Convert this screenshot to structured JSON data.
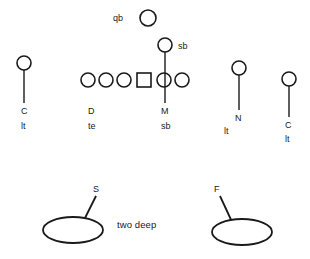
{
  "diagram": {
    "type": "football-defensive-formation",
    "caption": "two deep",
    "caption_pos": {
      "x": 117,
      "y": 220
    },
    "colors": {
      "stroke": "#1a1a1a",
      "fill": "#ffffff",
      "text": "#1a1a1a",
      "background": "#ffffff"
    },
    "canvas": {
      "width": 310,
      "height": 259
    },
    "line_of_scrimmage": {
      "note": "offensive line row of circles with center square",
      "y": 80
    },
    "offense": {
      "linemen": [
        {
          "name": "lineman-1",
          "shape": "circle",
          "cx": 88,
          "cy": 80,
          "r": 7
        },
        {
          "name": "lineman-2",
          "shape": "circle",
          "cx": 106,
          "cy": 80,
          "r": 7
        },
        {
          "name": "lineman-3",
          "shape": "circle",
          "cx": 124,
          "cy": 80,
          "r": 7
        },
        {
          "name": "center",
          "shape": "square",
          "cx": 144,
          "cy": 80,
          "size": 14
        },
        {
          "name": "lineman-4",
          "shape": "circle",
          "cx": 164,
          "cy": 80,
          "r": 7
        },
        {
          "name": "lineman-5",
          "shape": "circle",
          "cx": 182,
          "cy": 80,
          "r": 7
        }
      ],
      "backs": [
        {
          "name": "quarterback",
          "shape": "circle",
          "cx": 148,
          "cy": 18,
          "r": 8,
          "label": "qb",
          "label_pos": {
            "x": 113,
            "y": 14
          }
        },
        {
          "name": "slotback-top",
          "shape": "circle",
          "cx": 165,
          "cy": 45,
          "r": 7,
          "label": "sb",
          "label_pos": {
            "x": 178,
            "y": 42
          }
        }
      ]
    },
    "defenders": [
      {
        "name": "corner-left",
        "shape": "circle",
        "cx": 24,
        "cy": 63,
        "r": 7,
        "route": {
          "x1": 24,
          "y1": 63,
          "x2": 24,
          "y2": 103
        },
        "label_primary": "C",
        "label_secondary": "lt",
        "label_primary_pos": {
          "x": 21,
          "y": 107
        },
        "label_secondary_pos": {
          "x": 21,
          "y": 122
        }
      },
      {
        "name": "defensive-lineman-d",
        "shape": "none",
        "label_primary": "D",
        "label_secondary": "te",
        "label_primary_pos": {
          "x": 88,
          "y": 107
        },
        "label_secondary_pos": {
          "x": 88,
          "y": 122
        }
      },
      {
        "name": "mike-linebacker",
        "shape": "none",
        "route": {
          "x1": 165,
          "y1": 45,
          "x2": 165,
          "y2": 103
        },
        "label_primary": "M",
        "label_secondary": "sb",
        "label_primary_pos": {
          "x": 161,
          "y": 107
        },
        "label_secondary_pos": {
          "x": 161,
          "y": 122
        }
      },
      {
        "name": "nickel-back",
        "shape": "circle",
        "cx": 239,
        "cy": 68,
        "r": 7,
        "route": {
          "x1": 239,
          "y1": 68,
          "x2": 239,
          "y2": 110
        },
        "label_primary": "N",
        "label_secondary": "lt",
        "label_primary_pos": {
          "x": 235,
          "y": 114
        },
        "label_secondary_pos": {
          "x": 224,
          "y": 127
        }
      },
      {
        "name": "corner-right",
        "shape": "circle",
        "cx": 289,
        "cy": 79,
        "r": 7,
        "route": {
          "x1": 289,
          "y1": 79,
          "x2": 289,
          "y2": 117
        },
        "label_primary": "C",
        "label_secondary": "lt",
        "label_primary_pos": {
          "x": 285,
          "y": 121
        },
        "label_secondary_pos": {
          "x": 285,
          "y": 135
        }
      }
    ],
    "deep_zones": [
      {
        "name": "strong-safety-zone",
        "shape": "ellipse",
        "cx": 73,
        "cy": 230,
        "rx": 30,
        "ry": 13,
        "route": {
          "x1": 83,
          "y1": 222,
          "x2": 96,
          "y2": 196
        },
        "label": "S",
        "label_pos": {
          "x": 93,
          "y": 185
        }
      },
      {
        "name": "free-safety-zone",
        "shape": "ellipse",
        "cx": 242,
        "cy": 232,
        "rx": 30,
        "ry": 13,
        "route": {
          "x1": 233,
          "y1": 224,
          "x2": 220,
          "y2": 196
        },
        "label": "F",
        "label_pos": {
          "x": 214,
          "y": 185
        }
      }
    ]
  }
}
